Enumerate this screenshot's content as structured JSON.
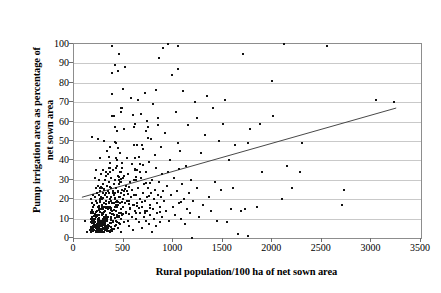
{
  "chart_data": {
    "type": "scatter",
    "title": "",
    "xlabel": "Rural population/100 ha of net sown area",
    "ylabel_line1": "Pump irrigation area as percentage of",
    "ylabel_line2": "net sown area",
    "xlim": [
      0,
      3500
    ],
    "ylim": [
      0,
      100
    ],
    "xticks": [
      0,
      500,
      1000,
      1500,
      2000,
      2500,
      3000,
      3500
    ],
    "yticks": [
      0,
      10,
      20,
      30,
      40,
      50,
      60,
      70,
      80,
      90,
      100
    ],
    "grid": "horizontal",
    "legend": "none",
    "marker": "small-black-square",
    "series": [
      {
        "name": "districts",
        "n_points": 540,
        "description": "Dense cluster of districts at low rural population (150-900) and low pump irrigation percentage (0-30), with a long upper tail reaching 100% and a sparse right tail out to 3250."
      }
    ],
    "trendline": {
      "type": "linear",
      "x_start": 80,
      "y_start": 21,
      "x_end": 3250,
      "y_end": 67,
      "slope_per_unit": 0.0145,
      "intercept": 19.8
    },
    "points": [
      [
        110,
        9
      ],
      [
        130,
        3
      ],
      [
        160,
        4
      ],
      [
        175,
        20
      ],
      [
        185,
        52
      ],
      [
        190,
        22
      ],
      [
        195,
        13
      ],
      [
        200,
        6
      ],
      [
        205,
        17
      ],
      [
        210,
        21
      ],
      [
        212,
        31
      ],
      [
        215,
        8
      ],
      [
        218,
        26
      ],
      [
        220,
        11
      ],
      [
        222,
        19
      ],
      [
        225,
        35
      ],
      [
        228,
        14
      ],
      [
        230,
        5
      ],
      [
        232,
        23
      ],
      [
        235,
        18
      ],
      [
        238,
        27
      ],
      [
        240,
        10
      ],
      [
        242,
        51
      ],
      [
        245,
        16
      ],
      [
        248,
        22
      ],
      [
        250,
        7
      ],
      [
        252,
        30
      ],
      [
        255,
        12
      ],
      [
        258,
        19
      ],
      [
        260,
        24
      ],
      [
        262,
        41
      ],
      [
        265,
        15
      ],
      [
        268,
        9
      ],
      [
        270,
        21
      ],
      [
        272,
        33
      ],
      [
        275,
        6
      ],
      [
        278,
        26
      ],
      [
        280,
        17
      ],
      [
        282,
        13
      ],
      [
        285,
        20
      ],
      [
        288,
        28
      ],
      [
        290,
        8
      ],
      [
        292,
        23
      ],
      [
        295,
        35
      ],
      [
        298,
        11
      ],
      [
        300,
        18
      ],
      [
        302,
        50
      ],
      [
        305,
        25
      ],
      [
        308,
        14
      ],
      [
        310,
        30
      ],
      [
        312,
        7
      ],
      [
        315,
        22
      ],
      [
        318,
        16
      ],
      [
        320,
        34
      ],
      [
        322,
        12
      ],
      [
        325,
        19
      ],
      [
        328,
        27
      ],
      [
        330,
        9
      ],
      [
        332,
        21
      ],
      [
        335,
        45
      ],
      [
        338,
        15
      ],
      [
        340,
        24
      ],
      [
        342,
        33
      ],
      [
        345,
        11
      ],
      [
        348,
        18
      ],
      [
        350,
        29
      ],
      [
        352,
        6
      ],
      [
        355,
        23
      ],
      [
        358,
        36
      ],
      [
        360,
        13
      ],
      [
        362,
        20
      ],
      [
        365,
        47
      ],
      [
        368,
        16
      ],
      [
        370,
        26
      ],
      [
        372,
        10
      ],
      [
        375,
        31
      ],
      [
        378,
        21
      ],
      [
        380,
        74
      ],
      [
        382,
        85
      ],
      [
        385,
        99
      ],
      [
        388,
        14
      ],
      [
        390,
        24
      ],
      [
        392,
        18
      ],
      [
        395,
        8
      ],
      [
        398,
        35
      ],
      [
        400,
        28
      ],
      [
        402,
        12
      ],
      [
        405,
        22
      ],
      [
        408,
        63
      ],
      [
        410,
        16
      ],
      [
        412,
        30
      ],
      [
        415,
        89
      ],
      [
        418,
        20
      ],
      [
        420,
        9
      ],
      [
        422,
        26
      ],
      [
        425,
        49
      ],
      [
        428,
        14
      ],
      [
        430,
        37
      ],
      [
        432,
        19
      ],
      [
        435,
        55
      ],
      [
        438,
        11
      ],
      [
        440,
        24
      ],
      [
        442,
        32
      ],
      [
        445,
        17
      ],
      [
        448,
        86
      ],
      [
        450,
        95
      ],
      [
        452,
        21
      ],
      [
        455,
        13
      ],
      [
        458,
        28
      ],
      [
        460,
        7
      ],
      [
        462,
        34
      ],
      [
        465,
        18
      ],
      [
        468,
        44
      ],
      [
        470,
        23
      ],
      [
        472,
        10
      ],
      [
        475,
        29
      ],
      [
        478,
        15
      ],
      [
        480,
        67
      ],
      [
        482,
        25
      ],
      [
        485,
        12
      ],
      [
        488,
        36
      ],
      [
        490,
        20
      ],
      [
        492,
        77
      ],
      [
        495,
        16
      ],
      [
        498,
        31
      ],
      [
        500,
        8
      ],
      [
        505,
        22
      ],
      [
        510,
        88
      ],
      [
        515,
        18
      ],
      [
        520,
        27
      ],
      [
        525,
        13
      ],
      [
        530,
        41
      ],
      [
        535,
        24
      ],
      [
        540,
        9
      ],
      [
        545,
        33
      ],
      [
        550,
        19
      ],
      [
        555,
        6
      ],
      [
        560,
        29
      ],
      [
        565,
        15
      ],
      [
        570,
        72
      ],
      [
        575,
        21
      ],
      [
        580,
        11
      ],
      [
        585,
        38
      ],
      [
        590,
        25
      ],
      [
        595,
        17
      ],
      [
        600,
        4
      ],
      [
        605,
        48
      ],
      [
        610,
        30
      ],
      [
        615,
        14
      ],
      [
        620,
        59
      ],
      [
        625,
        22
      ],
      [
        630,
        10
      ],
      [
        635,
        35
      ],
      [
        640,
        18
      ],
      [
        645,
        71
      ],
      [
        650,
        26
      ],
      [
        655,
        8
      ],
      [
        660,
        42
      ],
      [
        665,
        20
      ],
      [
        670,
        13
      ],
      [
        675,
        64
      ],
      [
        680,
        31
      ],
      [
        685,
        16
      ],
      [
        690,
        5
      ],
      [
        695,
        23
      ],
      [
        700,
        46
      ],
      [
        705,
        11
      ],
      [
        710,
        28
      ],
      [
        715,
        19
      ],
      [
        720,
        75
      ],
      [
        725,
        9
      ],
      [
        730,
        34
      ],
      [
        735,
        21
      ],
      [
        740,
        14
      ],
      [
        745,
        57
      ],
      [
        750,
        26
      ],
      [
        755,
        7
      ],
      [
        760,
        39
      ],
      [
        765,
        17
      ],
      [
        770,
        12
      ],
      [
        775,
        51
      ],
      [
        780,
        23
      ],
      [
        785,
        3
      ],
      [
        790,
        30
      ],
      [
        795,
        15
      ],
      [
        800,
        69
      ],
      [
        805,
        20
      ],
      [
        810,
        10
      ],
      [
        815,
        43
      ],
      [
        820,
        25
      ],
      [
        825,
        6
      ],
      [
        830,
        36
      ],
      [
        835,
        18
      ],
      [
        840,
        13
      ],
      [
        845,
        62
      ],
      [
        850,
        22
      ],
      [
        855,
        93
      ],
      [
        860,
        29
      ],
      [
        865,
        16
      ],
      [
        870,
        8
      ],
      [
        875,
        47
      ],
      [
        880,
        21
      ],
      [
        885,
        11
      ],
      [
        890,
        33
      ],
      [
        895,
        24
      ],
      [
        900,
        98
      ],
      [
        910,
        19
      ],
      [
        920,
        54
      ],
      [
        930,
        14
      ],
      [
        940,
        27
      ],
      [
        950,
        100
      ],
      [
        960,
        9
      ],
      [
        970,
        40
      ],
      [
        980,
        22
      ],
      [
        990,
        84
      ],
      [
        1000,
        16
      ],
      [
        1010,
        31
      ],
      [
        1020,
        12
      ],
      [
        1030,
        65
      ],
      [
        1040,
        24
      ],
      [
        1050,
        99
      ],
      [
        1060,
        18
      ],
      [
        1070,
        45
      ],
      [
        1080,
        10
      ],
      [
        1090,
        28
      ],
      [
        1100,
        76
      ],
      [
        1110,
        20
      ],
      [
        1120,
        7
      ],
      [
        1130,
        37
      ],
      [
        1140,
        15
      ],
      [
        1150,
        58
      ],
      [
        1160,
        23
      ],
      [
        1170,
        13
      ],
      [
        1180,
        30
      ],
      [
        1190,
        0
      ],
      [
        1200,
        19
      ],
      [
        1220,
        70
      ],
      [
        1240,
        26
      ],
      [
        1260,
        11
      ],
      [
        1280,
        44
      ],
      [
        1300,
        17
      ],
      [
        1320,
        53
      ],
      [
        1340,
        73
      ],
      [
        1360,
        21
      ],
      [
        1380,
        14
      ],
      [
        1400,
        67
      ],
      [
        1420,
        29
      ],
      [
        1440,
        9
      ],
      [
        1460,
        50
      ],
      [
        1480,
        25
      ],
      [
        1500,
        59
      ],
      [
        1520,
        71
      ],
      [
        1540,
        8
      ],
      [
        1560,
        40
      ],
      [
        1580,
        15
      ],
      [
        1600,
        26
      ],
      [
        1620,
        48
      ],
      [
        1650,
        2
      ],
      [
        1680,
        14
      ],
      [
        1700,
        95
      ],
      [
        1720,
        15
      ],
      [
        1750,
        1
      ],
      [
        1760,
        49
      ],
      [
        1780,
        56
      ],
      [
        1850,
        16
      ],
      [
        1880,
        59
      ],
      [
        1900,
        34
      ],
      [
        2000,
        81
      ],
      [
        2010,
        63
      ],
      [
        2100,
        20
      ],
      [
        2120,
        100
      ],
      [
        2150,
        37
      ],
      [
        2200,
        26
      ],
      [
        2280,
        34
      ],
      [
        2300,
        49
      ],
      [
        2550,
        99
      ],
      [
        2700,
        17
      ],
      [
        2720,
        25
      ],
      [
        3050,
        71
      ],
      [
        3230,
        70
      ]
    ]
  }
}
